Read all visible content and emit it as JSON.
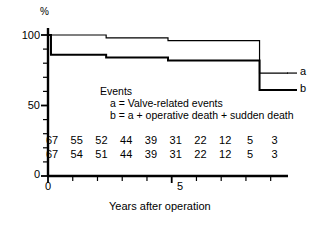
{
  "chart_data": {
    "type": "line",
    "subtype": "kaplan-meier-step",
    "title": "",
    "ylabel": "%",
    "xlabel": "Years after operation",
    "xlim": [
      0,
      9.7
    ],
    "ylim": [
      0,
      108
    ],
    "yticks_labeled": [
      0,
      50,
      100
    ],
    "yticks_minor_step": 10,
    "xticks_labeled": [
      0,
      5
    ],
    "xticks_step": 1,
    "grid": false,
    "legend_position": "inside-center",
    "legend_title": "Events",
    "legend_entries": [
      {
        "key": "a",
        "label": "a = Valve-related events"
      },
      {
        "key": "b",
        "label": "b = a + operative death + sudden death"
      }
    ],
    "curve_end_labels": [
      "a",
      "b"
    ],
    "series": [
      {
        "name": "a",
        "description": "Valve-related events",
        "steps": [
          {
            "x": 0.0,
            "y": 100
          },
          {
            "x": 2.35,
            "y": 100
          },
          {
            "x": 2.35,
            "y": 98
          },
          {
            "x": 4.85,
            "y": 98
          },
          {
            "x": 4.85,
            "y": 96
          },
          {
            "x": 8.55,
            "y": 96
          },
          {
            "x": 8.55,
            "y": 73
          },
          {
            "x": 9.7,
            "y": 73
          }
        ]
      },
      {
        "name": "b",
        "description": "a + operative death + sudden death",
        "steps": [
          {
            "x": 0.0,
            "y": 100
          },
          {
            "x": 0.12,
            "y": 86
          },
          {
            "x": 2.35,
            "y": 86
          },
          {
            "x": 2.35,
            "y": 84
          },
          {
            "x": 4.85,
            "y": 84
          },
          {
            "x": 4.85,
            "y": 82
          },
          {
            "x": 8.55,
            "y": 82
          },
          {
            "x": 8.55,
            "y": 61
          },
          {
            "x": 9.7,
            "y": 61
          }
        ]
      }
    ],
    "numbers_at_risk": {
      "x_positions": [
        0,
        1,
        2,
        3,
        4,
        5,
        6,
        7,
        8,
        9
      ],
      "rows": [
        {
          "series": "a",
          "values": [
            67,
            55,
            52,
            44,
            39,
            31,
            22,
            12,
            5,
            3
          ]
        },
        {
          "series": "b",
          "values": [
            67,
            54,
            51,
            44,
            39,
            31,
            22,
            12,
            5,
            3
          ]
        }
      ]
    },
    "colors": {
      "axis": "#000000",
      "curve_a": "#000000",
      "curve_b": "#000000",
      "background": "#ffffff"
    }
  },
  "axes": {
    "y_unit": "%",
    "y_tick_labels": [
      "100",
      "50",
      "0"
    ],
    "x_tick_labels": [
      "0",
      "5"
    ],
    "x_axis_title": "Years after operation"
  },
  "legend": {
    "title": "Events",
    "line_a": "a = Valve-related events",
    "line_b": "b = a + operative death + sudden death",
    "end_label_a": "a",
    "end_label_b": "b"
  }
}
